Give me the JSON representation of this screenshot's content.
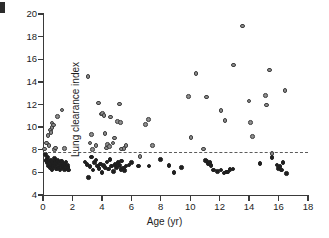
{
  "figure": {
    "panel_label": "",
    "background": "#ffffff"
  },
  "chart_data": {
    "type": "scatter",
    "title": "",
    "xlabel": "Age (yr)",
    "ylabel": "Lung clearance index",
    "xlim": [
      0,
      18
    ],
    "ylim": [
      4,
      20
    ],
    "xticks": [
      0,
      2,
      4,
      6,
      8,
      10,
      12,
      14,
      16,
      18
    ],
    "yticks": [
      4,
      6,
      8,
      10,
      12,
      14,
      16,
      18,
      20
    ],
    "xticklabels": [
      "0",
      "2",
      "4",
      "6",
      "8",
      "10",
      "12",
      "14",
      "16",
      "18"
    ],
    "yticklabels": [
      "4",
      "6",
      "8",
      "10",
      "12",
      "14",
      "16",
      "18",
      "20"
    ],
    "grid": false,
    "legend": null,
    "annotations": [
      {
        "name": "upper-limit-of-normal-line",
        "kind": "hline",
        "y": 7.8,
        "style": "dashed",
        "color": "#5c5c5c"
      }
    ],
    "marker_colors": {
      "above_line_fill": "#8d8d8d",
      "above_line_edge": "#3d3d3d",
      "below_line_fill": "#1f1f1f",
      "below_line_edge": "#1f1f1f"
    },
    "series": [
      {
        "name": "Abnormal LCI (above upper limit of normal)",
        "style": "gray-filled circle",
        "points": [
          [
            0.12,
            8.05
          ],
          [
            0.25,
            8.6
          ],
          [
            0.35,
            9.25
          ],
          [
            0.42,
            8.35
          ],
          [
            0.5,
            9.75
          ],
          [
            0.55,
            9.55
          ],
          [
            0.6,
            9.95
          ],
          [
            0.62,
            10.35
          ],
          [
            0.72,
            10.2
          ],
          [
            0.78,
            8.0
          ],
          [
            0.85,
            8.15
          ],
          [
            1.0,
            10.95
          ],
          [
            1.3,
            11.5
          ],
          [
            1.45,
            8.1
          ],
          [
            3.05,
            14.5
          ],
          [
            3.2,
            8.6
          ],
          [
            3.3,
            9.35
          ],
          [
            3.35,
            8.0
          ],
          [
            3.6,
            8.35
          ],
          [
            3.75,
            12.15
          ],
          [
            3.95,
            11.15
          ],
          [
            4.05,
            11.2
          ],
          [
            4.15,
            11.05
          ],
          [
            4.2,
            9.45
          ],
          [
            4.3,
            8.15
          ],
          [
            4.4,
            8.45
          ],
          [
            4.5,
            8.3
          ],
          [
            4.6,
            10.9
          ],
          [
            4.75,
            8.6
          ],
          [
            4.85,
            9.05
          ],
          [
            5.05,
            10.5
          ],
          [
            5.2,
            12.05
          ],
          [
            5.25,
            10.4
          ],
          [
            5.35,
            8.05
          ],
          [
            5.5,
            8.1
          ],
          [
            5.65,
            8.35
          ],
          [
            6.6,
            7.4
          ],
          [
            6.95,
            10.25
          ],
          [
            7.15,
            10.65
          ],
          [
            7.45,
            8.35
          ],
          [
            9.9,
            12.7
          ],
          [
            10.05,
            9.1
          ],
          [
            10.4,
            14.75
          ],
          [
            10.9,
            8.05
          ],
          [
            11.1,
            12.65
          ],
          [
            12.1,
            11.45
          ],
          [
            12.35,
            10.6
          ],
          [
            12.95,
            15.5
          ],
          [
            13.55,
            18.95
          ],
          [
            14.0,
            12.3
          ],
          [
            14.1,
            10.4
          ],
          [
            14.25,
            9.15
          ],
          [
            15.1,
            12.8
          ],
          [
            15.2,
            11.95
          ],
          [
            15.4,
            15.05
          ],
          [
            15.55,
            7.65
          ],
          [
            16.45,
            13.25
          ]
        ]
      },
      {
        "name": "Normal LCI (at or below upper limit of normal)",
        "style": "black filled circle",
        "points": [
          [
            0.15,
            7.6
          ],
          [
            0.2,
            7.05
          ],
          [
            0.28,
            6.85
          ],
          [
            0.3,
            7.3
          ],
          [
            0.38,
            6.55
          ],
          [
            0.45,
            6.95
          ],
          [
            0.5,
            6.4
          ],
          [
            0.55,
            7.1
          ],
          [
            0.58,
            6.7
          ],
          [
            0.62,
            6.25
          ],
          [
            0.68,
            6.85
          ],
          [
            0.72,
            6.5
          ],
          [
            0.78,
            7.25
          ],
          [
            0.82,
            6.6
          ],
          [
            0.85,
            6.95
          ],
          [
            0.9,
            6.3
          ],
          [
            0.95,
            6.75
          ],
          [
            1.0,
            7.05
          ],
          [
            1.05,
            6.45
          ],
          [
            1.1,
            6.9
          ],
          [
            1.15,
            6.2
          ],
          [
            1.2,
            6.65
          ],
          [
            1.25,
            7.0
          ],
          [
            1.3,
            6.4
          ],
          [
            1.35,
            6.8
          ],
          [
            1.4,
            6.55
          ],
          [
            1.45,
            6.25
          ],
          [
            1.5,
            6.7
          ],
          [
            1.55,
            6.9
          ],
          [
            1.6,
            6.3
          ],
          [
            1.65,
            6.6
          ],
          [
            1.7,
            6.45
          ],
          [
            1.75,
            6.2
          ],
          [
            2.85,
            6.9
          ],
          [
            3.0,
            6.7
          ],
          [
            3.1,
            5.55
          ],
          [
            3.2,
            6.5
          ],
          [
            3.3,
            7.35
          ],
          [
            3.4,
            6.2
          ],
          [
            3.5,
            6.85
          ],
          [
            3.6,
            7.1
          ],
          [
            3.7,
            6.55
          ],
          [
            3.8,
            6.35
          ],
          [
            3.9,
            6.75
          ],
          [
            4.0,
            6.0
          ],
          [
            4.1,
            6.6
          ],
          [
            4.2,
            6.45
          ],
          [
            4.35,
            6.9
          ],
          [
            4.45,
            6.3
          ],
          [
            4.55,
            7.15
          ],
          [
            4.65,
            6.55
          ],
          [
            4.8,
            6.1
          ],
          [
            4.9,
            6.7
          ],
          [
            5.0,
            6.45
          ],
          [
            5.1,
            6.85
          ],
          [
            5.2,
            6.6
          ],
          [
            5.3,
            6.25
          ],
          [
            5.35,
            7.0
          ],
          [
            5.45,
            6.4
          ],
          [
            5.55,
            6.15
          ],
          [
            5.65,
            6.55
          ],
          [
            5.85,
            6.65
          ],
          [
            6.0,
            6.85
          ],
          [
            6.5,
            6.55
          ],
          [
            7.2,
            6.55
          ],
          [
            8.0,
            7.15
          ],
          [
            8.55,
            6.6
          ],
          [
            8.9,
            6.0
          ],
          [
            9.4,
            6.45
          ],
          [
            11.05,
            7.05
          ],
          [
            11.15,
            6.95
          ],
          [
            11.25,
            6.75
          ],
          [
            11.35,
            6.85
          ],
          [
            11.4,
            6.6
          ],
          [
            11.6,
            6.2
          ],
          [
            11.85,
            6.1
          ],
          [
            12.1,
            6.2
          ],
          [
            12.3,
            5.95
          ],
          [
            12.45,
            6.05
          ],
          [
            12.55,
            6.05
          ],
          [
            12.7,
            6.25
          ],
          [
            12.9,
            6.3
          ],
          [
            14.75,
            6.8
          ],
          [
            15.55,
            7.3
          ],
          [
            15.9,
            6.65
          ],
          [
            16.0,
            6.35
          ],
          [
            16.1,
            6.5
          ],
          [
            16.2,
            6.2
          ],
          [
            16.3,
            6.85
          ],
          [
            16.55,
            5.9
          ]
        ]
      }
    ]
  }
}
